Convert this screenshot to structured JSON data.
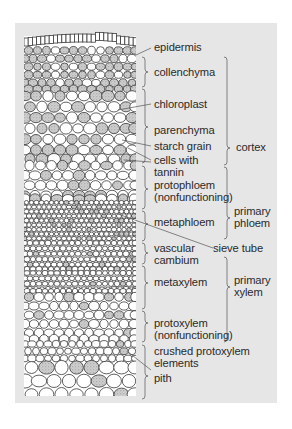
{
  "figure": {
    "background": "#ffffff",
    "panel_color": "#e6e6e6",
    "ink_color": "#333333",
    "stipple_color": "#9a9a9a"
  },
  "labels": {
    "epidermis": "epidermis",
    "collenchyma": "collenchyma",
    "chloroplast": "chloroplast",
    "parenchyma": "parenchyma",
    "starch_grain": "starch grain",
    "cells_with_tannin": "cells with\ntannin",
    "protophloem": "protophloem\n(nonfunctioning)",
    "metaphloem": "metaphloem",
    "vascular_cambium": "vascular\ncambium",
    "sieve_tube": "sieve tube",
    "metaxylem": "metaxylem",
    "protoxylem": "protoxylem\n(nonfunctioning)",
    "crushed_protoxylem": "crushed protoxylem\nelements",
    "pith": "pith"
  },
  "groups": {
    "cortex": "cortex",
    "primary_phloem": "primary\nphloem",
    "primary_xylem": "primary\nxylem"
  }
}
